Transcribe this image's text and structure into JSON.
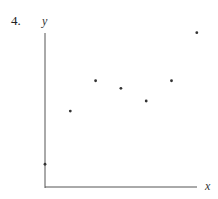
{
  "problem": {
    "number": "4."
  },
  "chart_data": {
    "type": "scatter",
    "title": "",
    "xlabel": "x",
    "ylabel": "y",
    "grid": false,
    "legend": null,
    "x": [
      0,
      1,
      2,
      3,
      4,
      5,
      6
    ],
    "y": [
      0.9,
      3.0,
      4.2,
      3.9,
      3.4,
      4.2,
      6.1
    ],
    "xlim": [
      0,
      6.1
    ],
    "ylim": [
      0,
      6.1
    ],
    "tick_labels": {
      "x": [],
      "y": []
    }
  },
  "layout": {
    "origin_px": [
      45,
      187
    ],
    "unit_px": 25.3,
    "x_axis_end_px": 197,
    "y_axis_top_px": 33
  },
  "colors": {
    "axis": "#555555",
    "point": "#333333"
  }
}
